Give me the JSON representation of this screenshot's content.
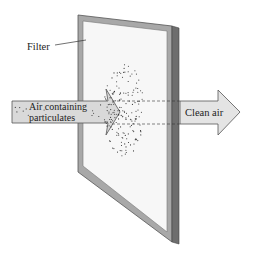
{
  "diagram": {
    "labels": {
      "filter": "Filter",
      "input_line1": "Air containing",
      "input_line2": "particulates",
      "output": "Clean air"
    },
    "colors": {
      "frame_face": "#a8a8a8",
      "frame_edge": "#6e6e6e",
      "filter_surface": "#f7f7f7",
      "arrow_fill": "#d9d9d9",
      "arrow_stroke": "#555555",
      "particles": "#333333",
      "text": "#222222"
    }
  }
}
